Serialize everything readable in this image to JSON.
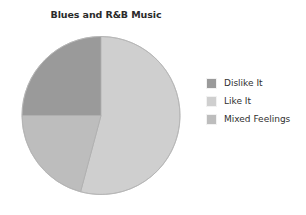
{
  "chart_data": {
    "type": "pie",
    "title": "Blues and R&B Music",
    "categories": [
      "Dislike It",
      "Like It",
      "Mixed Feelings"
    ],
    "values": [
      25,
      54,
      21
    ],
    "units": "percent",
    "colors": [
      "#9a9a9a",
      "#cfcfcf",
      "#bdbdbd"
    ],
    "start_angle_deg": 0,
    "direction": "clockwise",
    "legend_position": "right",
    "grid": false,
    "xlabel": "",
    "ylabel": "",
    "slices": [
      {
        "label": "Dislike It",
        "value": 25,
        "color": "#9a9a9a",
        "start_deg": 270,
        "end_deg": 360
      },
      {
        "label": "Like It",
        "value": 54,
        "color": "#cfcfcf",
        "start_deg": 0,
        "end_deg": 195
      },
      {
        "label": "Mixed Feelings",
        "value": 21,
        "color": "#bdbdbd",
        "start_deg": 195,
        "end_deg": 270
      }
    ]
  },
  "title": {
    "text": "Blues and R&B Music"
  },
  "legend": {
    "items": [
      {
        "label": "Dislike It",
        "color": "#9a9a9a",
        "swatch_name": "legend-swatch-dislike-it"
      },
      {
        "label": "Like It",
        "color": "#cfcfcf",
        "swatch_name": "legend-swatch-like-it"
      },
      {
        "label": "Mixed Feelings",
        "color": "#bdbdbd",
        "swatch_name": "legend-swatch-mixed-feelings"
      }
    ]
  },
  "pie": {
    "center_x": 80,
    "center_y": 80.5,
    "radius": 79,
    "outline_color": "#b0b0b0"
  }
}
